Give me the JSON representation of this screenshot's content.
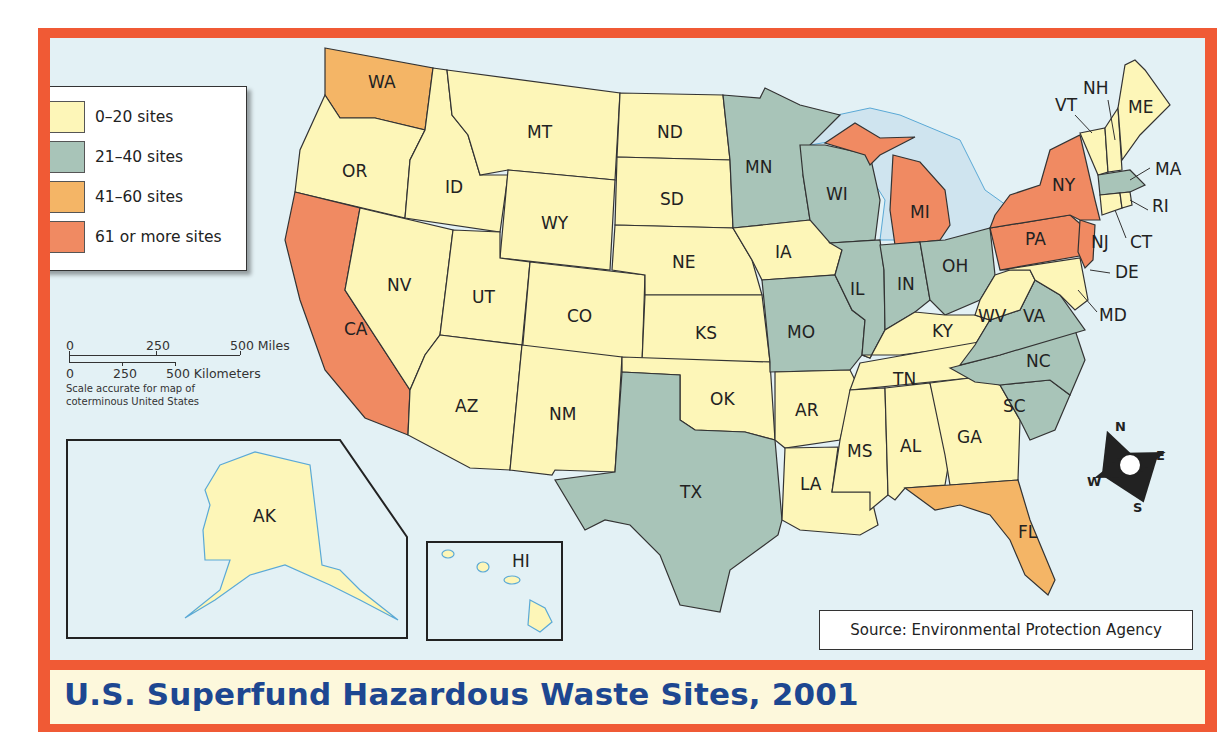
{
  "title": "U.S. Superfund Hazardous Waste Sites, 2001",
  "source": "Source: Environmental Protection Agency",
  "legend": {
    "items": [
      {
        "label": "0–20 sites",
        "color": "#fdf6b8"
      },
      {
        "label": "21–40 sites",
        "color": "#a8c4b8"
      },
      {
        "label": "41–60 sites",
        "color": "#f4b566"
      },
      {
        "label": "61 or more sites",
        "color": "#f08a62"
      }
    ]
  },
  "scale": {
    "miles": {
      "ticks": [
        "0",
        "250",
        "500 Miles"
      ]
    },
    "km": {
      "ticks": [
        "0",
        "250",
        "500 Kilometers"
      ]
    },
    "note_line1": "Scale accurate for map of",
    "note_line2": "coterminous United States"
  },
  "compass": {
    "n": "N",
    "e": "E",
    "s": "S",
    "w": "W"
  },
  "insets": {
    "alaska": "AK",
    "hawaii": "HI"
  },
  "colors": {
    "frame": "#f05a35",
    "water": "#e3f1f5",
    "title_text": "#1d4791",
    "title_band": "#fdf8dc"
  },
  "states": {
    "WA": {
      "label": "WA",
      "category": "41–60 sites"
    },
    "OR": {
      "label": "OR",
      "category": "0–20 sites"
    },
    "CA": {
      "label": "CA",
      "category": "61 or more sites"
    },
    "ID": {
      "label": "ID",
      "category": "0–20 sites"
    },
    "NV": {
      "label": "NV",
      "category": "0–20 sites"
    },
    "MT": {
      "label": "MT",
      "category": "0–20 sites"
    },
    "WY": {
      "label": "WY",
      "category": "0–20 sites"
    },
    "UT": {
      "label": "UT",
      "category": "0–20 sites"
    },
    "CO": {
      "label": "CO",
      "category": "0–20 sites"
    },
    "AZ": {
      "label": "AZ",
      "category": "0–20 sites"
    },
    "NM": {
      "label": "NM",
      "category": "0–20 sites"
    },
    "ND": {
      "label": "ND",
      "category": "0–20 sites"
    },
    "SD": {
      "label": "SD",
      "category": "0–20 sites"
    },
    "NE": {
      "label": "NE",
      "category": "0–20 sites"
    },
    "KS": {
      "label": "KS",
      "category": "0–20 sites"
    },
    "OK": {
      "label": "OK",
      "category": "0–20 sites"
    },
    "TX": {
      "label": "TX",
      "category": "21–40 sites"
    },
    "MN": {
      "label": "MN",
      "category": "21–40 sites"
    },
    "IA": {
      "label": "IA",
      "category": "0–20 sites"
    },
    "MO": {
      "label": "MO",
      "category": "21–40 sites"
    },
    "AR": {
      "label": "AR",
      "category": "0–20 sites"
    },
    "LA": {
      "label": "LA",
      "category": "0–20 sites"
    },
    "WI": {
      "label": "WI",
      "category": "21–40 sites"
    },
    "IL": {
      "label": "IL",
      "category": "21–40 sites"
    },
    "MI": {
      "label": "MI",
      "category": "61 or more sites"
    },
    "IN": {
      "label": "IN",
      "category": "21–40 sites"
    },
    "OH": {
      "label": "OH",
      "category": "21–40 sites"
    },
    "KY": {
      "label": "KY",
      "category": "0–20 sites"
    },
    "TN": {
      "label": "TN",
      "category": "0–20 sites"
    },
    "MS": {
      "label": "MS",
      "category": "0–20 sites"
    },
    "AL": {
      "label": "AL",
      "category": "0–20 sites"
    },
    "GA": {
      "label": "GA",
      "category": "0–20 sites"
    },
    "FL": {
      "label": "FL",
      "category": "41–60 sites"
    },
    "SC": {
      "label": "SC",
      "category": "21–40 sites"
    },
    "NC": {
      "label": "NC",
      "category": "21–40 sites"
    },
    "VA": {
      "label": "VA",
      "category": "21–40 sites"
    },
    "WV": {
      "label": "WV",
      "category": "0–20 sites"
    },
    "MD": {
      "label": "MD",
      "category": "0–20 sites"
    },
    "DE": {
      "label": "DE",
      "category": "0–20 sites"
    },
    "PA": {
      "label": "PA",
      "category": "61 or more sites"
    },
    "NJ": {
      "label": "NJ",
      "category": "61 or more sites"
    },
    "NY": {
      "label": "NY",
      "category": "61 or more sites"
    },
    "CT": {
      "label": "CT",
      "category": "0–20 sites"
    },
    "RI": {
      "label": "RI",
      "category": "0–20 sites"
    },
    "MA": {
      "label": "MA",
      "category": "21–40 sites"
    },
    "VT": {
      "label": "VT",
      "category": "0–20 sites"
    },
    "NH": {
      "label": "NH",
      "category": "0–20 sites"
    },
    "ME": {
      "label": "ME",
      "category": "0–20 sites"
    },
    "AK": {
      "label": "AK",
      "category": "0–20 sites"
    },
    "HI": {
      "label": "HI",
      "category": "0–20 sites"
    }
  }
}
